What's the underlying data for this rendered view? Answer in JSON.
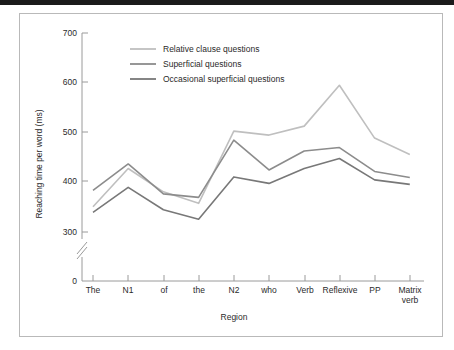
{
  "figure": {
    "frame_color": "#b9b9b9",
    "background": "#ffffff",
    "top_rule_color": "#1b1b1b"
  },
  "chart_data": {
    "type": "line",
    "title": "",
    "xlabel": "Region",
    "ylabel": "Reaching time per word (ms)",
    "categories": [
      "The",
      "N1",
      "of",
      "the",
      "N2",
      "who",
      "Verb",
      "Reflexive",
      "PP",
      "Matrix verb"
    ],
    "category_labels_wrapped": [
      [
        "The"
      ],
      [
        "N1"
      ],
      [
        "of"
      ],
      [
        "the"
      ],
      [
        "N2"
      ],
      [
        "who"
      ],
      [
        "Verb"
      ],
      [
        "Reflexive"
      ],
      [
        "PP"
      ],
      [
        "Matrix",
        "verb"
      ]
    ],
    "ylim": [
      300,
      700
    ],
    "yticks": [
      300,
      400,
      500,
      600,
      700
    ],
    "ytick_labels": [
      "300",
      "400",
      "500",
      "600",
      "700"
    ],
    "y_origin_label": "0",
    "axis_break": true,
    "grid": false,
    "legend_position": "upper-left-inside",
    "series": [
      {
        "name": "Relative clause questions",
        "color": "#bfbfbf",
        "values": [
          351,
          428,
          381,
          358,
          503,
          495,
          513,
          595,
          489,
          456
        ]
      },
      {
        "name": "Superficial questions",
        "color": "#8c8c8c",
        "values": [
          384,
          437,
          377,
          370,
          485,
          425,
          463,
          470,
          422,
          410
        ]
      },
      {
        "name": "Occasional superficial questions",
        "color": "#787878",
        "values": [
          340,
          390,
          345,
          326,
          411,
          398,
          428,
          448,
          405,
          396
        ]
      }
    ]
  }
}
